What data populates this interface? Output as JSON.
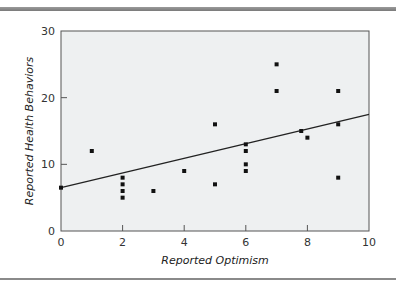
{
  "chart_data": {
    "type": "scatter",
    "title": "",
    "xlabel": "Reported Optimism",
    "ylabel": "Reported Health Behaviors",
    "xlim": [
      0,
      10
    ],
    "ylim": [
      0,
      30
    ],
    "xticks": [
      0,
      2,
      4,
      6,
      8,
      10
    ],
    "yticks": [
      0,
      10,
      20,
      30
    ],
    "grid": false,
    "legend": null,
    "points": [
      {
        "x": 0,
        "y": 6.5
      },
      {
        "x": 1,
        "y": 12
      },
      {
        "x": 2,
        "y": 8
      },
      {
        "x": 2,
        "y": 7
      },
      {
        "x": 2,
        "y": 6
      },
      {
        "x": 2,
        "y": 5
      },
      {
        "x": 3,
        "y": 6
      },
      {
        "x": 4,
        "y": 9
      },
      {
        "x": 5,
        "y": 16
      },
      {
        "x": 5,
        "y": 7
      },
      {
        "x": 6,
        "y": 13
      },
      {
        "x": 6,
        "y": 12
      },
      {
        "x": 6,
        "y": 10
      },
      {
        "x": 6,
        "y": 9
      },
      {
        "x": 7,
        "y": 25
      },
      {
        "x": 7,
        "y": 21
      },
      {
        "x": 7.8,
        "y": 15
      },
      {
        "x": 8,
        "y": 14
      },
      {
        "x": 9,
        "y": 21
      },
      {
        "x": 9,
        "y": 16
      },
      {
        "x": 9,
        "y": 8
      }
    ],
    "regression_line": {
      "x0": 0,
      "y0": 6.5,
      "x1": 10,
      "y1": 17.5
    },
    "colors": {
      "plot_background": "#eef0f1",
      "points": "#111111",
      "line": "#222222",
      "frame": "#555555"
    }
  },
  "axes": {
    "x_title": "Reported Optimism",
    "y_title": "Reported Health Behaviors",
    "x_tick_labels": [
      "0",
      "2",
      "4",
      "6",
      "8",
      "10"
    ],
    "y_tick_labels": [
      "0",
      "10",
      "20",
      "30"
    ]
  }
}
